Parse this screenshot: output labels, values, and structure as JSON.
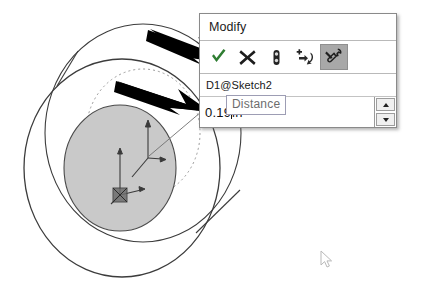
{
  "app": {
    "name": "CAD dimension editor",
    "background_color": "#ffffff"
  },
  "dialog": {
    "title": "Modify",
    "toolbar": [
      {
        "name": "accept-checkmark",
        "label": "Save the current value and exit the dialog",
        "icon": "checkmark-icon",
        "state": "normal"
      },
      {
        "name": "cancel-x",
        "label": "Restore the original value and exit the dialog",
        "icon": "close-x-icon",
        "state": "normal"
      },
      {
        "name": "rebuild",
        "label": "Rebuild the model with the current value",
        "icon": "rebuild-icon",
        "state": "normal"
      },
      {
        "name": "reset-increment",
        "label": "Reset spin increment value",
        "icon": "spin-increment-icon",
        "state": "normal"
      },
      {
        "name": "mark-for-drawing",
        "label": "Mark dimension to be imported into drawing",
        "icon": "wrench-icon",
        "state": "pressed"
      }
    ],
    "dimension_name": "D1@Sketch2",
    "value": "0.19in",
    "value_number": "0.19",
    "value_units": "in",
    "caret_after": "0.19",
    "spinner": {
      "up": "increase-value",
      "down": "decrease-value"
    }
  },
  "tooltip": {
    "text": "Distance",
    "border_color": "#9d9db4",
    "text_color": "#6d6d6d"
  },
  "annotations": {
    "arrows": [
      {
        "name": "annotation-arrow-top",
        "points_to": "accept-checkmark",
        "color": "#000000"
      },
      {
        "name": "annotation-arrow-bottom",
        "points_to": "dimension-value-field",
        "color": "#000000"
      }
    ]
  },
  "model": {
    "type": "cylinder-washer",
    "shaded_face_color": "#c9c9c9",
    "edge_color": "#3a3a3a",
    "hidden_edge_color": "#9a9a9a",
    "origin_triad": "origin-triad",
    "sketch_triad": "sketch-triad"
  },
  "cursor": {
    "name": "mouse-pointer",
    "x": 320,
    "y": 250
  }
}
